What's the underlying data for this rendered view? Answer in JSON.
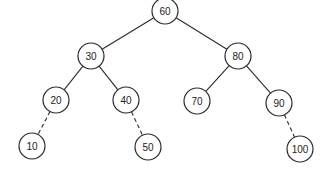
{
  "diagram": {
    "type": "binary-search-tree",
    "node_radius": 13,
    "colors": {
      "stroke": "#2a2a2a",
      "fill": "#ffffff",
      "text": "#222222"
    },
    "nodes": [
      {
        "id": "n60",
        "label": "60",
        "x": 165,
        "y": 11
      },
      {
        "id": "n30",
        "label": "30",
        "x": 91,
        "y": 56
      },
      {
        "id": "n80",
        "label": "80",
        "x": 238,
        "y": 56
      },
      {
        "id": "n20",
        "label": "20",
        "x": 56,
        "y": 100
      },
      {
        "id": "n40",
        "label": "40",
        "x": 126,
        "y": 100
      },
      {
        "id": "n70",
        "label": "70",
        "x": 197,
        "y": 101
      },
      {
        "id": "n90",
        "label": "90",
        "x": 279,
        "y": 103
      },
      {
        "id": "n10",
        "label": "10",
        "x": 32,
        "y": 146
      },
      {
        "id": "n50",
        "label": "50",
        "x": 148,
        "y": 147
      },
      {
        "id": "n100",
        "label": "100",
        "x": 300,
        "y": 149
      }
    ],
    "edges": [
      {
        "from": "n60",
        "to": "n30",
        "style": "solid"
      },
      {
        "from": "n60",
        "to": "n80",
        "style": "solid"
      },
      {
        "from": "n30",
        "to": "n20",
        "style": "solid"
      },
      {
        "from": "n30",
        "to": "n40",
        "style": "solid"
      },
      {
        "from": "n80",
        "to": "n70",
        "style": "solid"
      },
      {
        "from": "n80",
        "to": "n90",
        "style": "solid"
      },
      {
        "from": "n20",
        "to": "n10",
        "style": "dashed"
      },
      {
        "from": "n40",
        "to": "n50",
        "style": "dashed"
      },
      {
        "from": "n90",
        "to": "n100",
        "style": "dashed"
      }
    ]
  }
}
